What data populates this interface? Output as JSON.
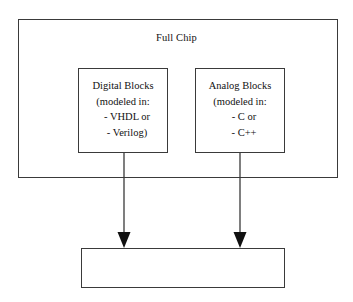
{
  "diagram": {
    "title": "Full Chip",
    "outer_block": {
      "label": "Full Chip"
    },
    "blocks": [
      {
        "name": "digital-blocks",
        "lines": [
          "Digital Blocks",
          "(modeled in:",
          "- VHDL or",
          "- Verilog)"
        ]
      },
      {
        "name": "analog-blocks",
        "lines": [
          "Analog Blocks",
          "(modeled in:",
          "- C or",
          "- C++"
        ]
      }
    ],
    "target_block": {
      "label": "Simulator"
    },
    "connections": [
      {
        "from": "digital-blocks",
        "to": "simulator",
        "arrow": "down-arrow-icon"
      },
      {
        "from": "analog-blocks",
        "to": "simulator",
        "arrow": "down-arrow-icon"
      }
    ],
    "colors": {
      "stroke": "#3a3a3a",
      "background": "#ffffff",
      "text": "#111111"
    }
  }
}
